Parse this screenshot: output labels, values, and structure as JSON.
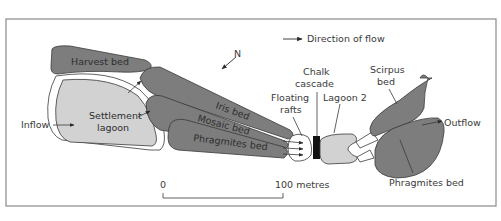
{
  "figure": {
    "legend": {
      "arrow_label": "Direction of flow"
    },
    "north_label": "N",
    "labels": {
      "harvest_bed": "Harvest bed",
      "iris_bed": "Iris bed",
      "mosaic_bed": "Mosaic bed",
      "phragmites_bed_left": "Phragmites bed",
      "settlement_lagoon_line1": "Settlement",
      "settlement_lagoon_line2": "lagoon",
      "inflow": "Inflow",
      "floating_rafts_line1": "Floating",
      "floating_rafts_line2": "rafts",
      "chalk_cascade_line1": "Chalk",
      "chalk_cascade_line2": "cascade",
      "lagoon_2": "Lagoon 2",
      "scirpus_bed_line1": "Scirpus",
      "scirpus_bed_line2": "bed",
      "outflow": "Outflow",
      "phragmites_bed_right": "Phragmites bed"
    },
    "scale_bar": {
      "start_label": "0",
      "end_label": "100 metres"
    },
    "colors": {
      "bed_fill": "#7d7d7d",
      "lagoon_fill": "#d2d2d2",
      "outline": "#3a3a3a",
      "frame": "#8a8a8a",
      "cascade": "#111111"
    }
  }
}
